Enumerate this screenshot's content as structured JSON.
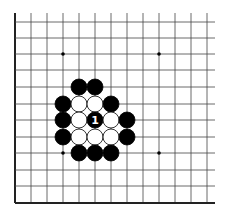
{
  "diagram": {
    "type": "go-board-fragment",
    "grid": {
      "x_lines": [
        15,
        31,
        47,
        63,
        79,
        95,
        111,
        127,
        143,
        159,
        175,
        191,
        207
      ],
      "y_lines": [
        22,
        38,
        54,
        70,
        87,
        104,
        120,
        137,
        153,
        170,
        186,
        203
      ],
      "x_end": 215,
      "y_start": 13,
      "line_color": "#444444",
      "edge_color": "#222222"
    },
    "star_points": [
      [
        3,
        2
      ],
      [
        9,
        2
      ],
      [
        3,
        8
      ],
      [
        9,
        8
      ]
    ],
    "stones": [
      {
        "col": 4,
        "row": 4,
        "color": "black"
      },
      {
        "col": 5,
        "row": 4,
        "color": "black"
      },
      {
        "col": 3,
        "row": 5,
        "color": "black"
      },
      {
        "col": 4,
        "row": 5,
        "color": "white"
      },
      {
        "col": 5,
        "row": 5,
        "color": "white"
      },
      {
        "col": 6,
        "row": 5,
        "color": "black"
      },
      {
        "col": 3,
        "row": 6,
        "color": "black"
      },
      {
        "col": 4,
        "row": 6,
        "color": "white"
      },
      {
        "col": 5,
        "row": 6,
        "color": "black",
        "label": "1"
      },
      {
        "col": 6,
        "row": 6,
        "color": "white"
      },
      {
        "col": 7,
        "row": 6,
        "color": "black"
      },
      {
        "col": 3,
        "row": 7,
        "color": "black"
      },
      {
        "col": 4,
        "row": 7,
        "color": "white"
      },
      {
        "col": 5,
        "row": 7,
        "color": "white"
      },
      {
        "col": 6,
        "row": 7,
        "color": "white"
      },
      {
        "col": 7,
        "row": 7,
        "color": "black"
      },
      {
        "col": 4,
        "row": 8,
        "color": "black"
      },
      {
        "col": 5,
        "row": 8,
        "color": "black"
      },
      {
        "col": 6,
        "row": 8,
        "color": "black"
      }
    ],
    "stone_radius": 8
  }
}
